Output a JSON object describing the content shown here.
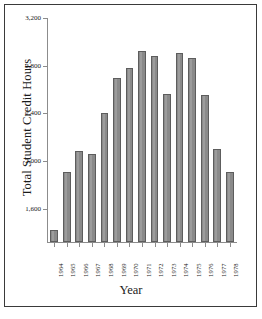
{
  "chart_data": {
    "type": "bar",
    "title": "",
    "subtitle": "",
    "xlabel": "Year",
    "ylabel": "Total Student Credit Hours",
    "categories": [
      "1964",
      "1965",
      "1966",
      "1967",
      "1968",
      "1969",
      "1970",
      "1971",
      "1972",
      "1973",
      "1974",
      "1975",
      "1976",
      "1977",
      "1978"
    ],
    "values": [
      1420,
      1910,
      2080,
      2055,
      2400,
      2695,
      2780,
      2925,
      2880,
      2560,
      2905,
      2865,
      2550,
      2100,
      1910
    ],
    "series": [
      {
        "name": "Total Student Credit Hours",
        "values": [
          1420,
          1910,
          2080,
          2055,
          2400,
          2695,
          2780,
          2925,
          2880,
          2560,
          2905,
          2865,
          2550,
          2100,
          1910
        ]
      }
    ],
    "ylim": [
      1320,
      3200
    ],
    "ytick_values": [
      1600,
      2000,
      2400,
      2800,
      3200
    ],
    "ytick_labels": [
      "1,600",
      "2,000",
      "2,400",
      "2,800",
      "3,200"
    ],
    "grid": false,
    "legend": null,
    "legend_position": "none",
    "bar_color": "#8a8a8a",
    "bar_edge_color": "#5d5d5d",
    "axis_color": "#8c8c8c",
    "frame_color": "#3a3a3a",
    "background_color": "#ffffff",
    "text_color": "#1a1a1a",
    "annotations": []
  }
}
